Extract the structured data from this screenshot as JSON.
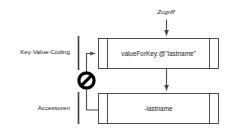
{
  "diagram": {
    "title_label": "Zugriff",
    "side_labels": {
      "upper": "Key-Value-Coding",
      "lower": "Accessoren"
    },
    "boxes": [
      {
        "id": "kvc-box",
        "text": "valueForKey:@\"lastname\""
      },
      {
        "id": "accessor-box",
        "text": "-lastname"
      }
    ],
    "icons": {
      "prohibition": "prohibition-sign"
    },
    "colors": {
      "stroke": "#3a3a3a",
      "arrow": "#4a4a4a",
      "text": "#1a1a1a",
      "background": "#ffffff",
      "ban": "#000000"
    }
  }
}
